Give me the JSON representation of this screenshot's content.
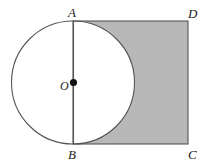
{
  "figure": {
    "background_color": "#ffffff",
    "shaded_color": "#b8b8b8",
    "stroke_color": "#555555",
    "point_color": "#111111",
    "labels": {
      "A": "A",
      "B": "B",
      "C": "C",
      "D": "D",
      "O": "O"
    },
    "geometry": {
      "circle": {
        "cx": 73,
        "cy": 82.5,
        "r": 61.5
      },
      "square": {
        "x": 73,
        "y": 21,
        "width": 115,
        "height": 123
      },
      "center_dot": {
        "cx": 73.5,
        "cy": 82.5,
        "r": 3.6
      },
      "segment_AB": {
        "x1": 73.5,
        "y1": 21,
        "x2": 73.5,
        "y2": 144
      }
    }
  }
}
